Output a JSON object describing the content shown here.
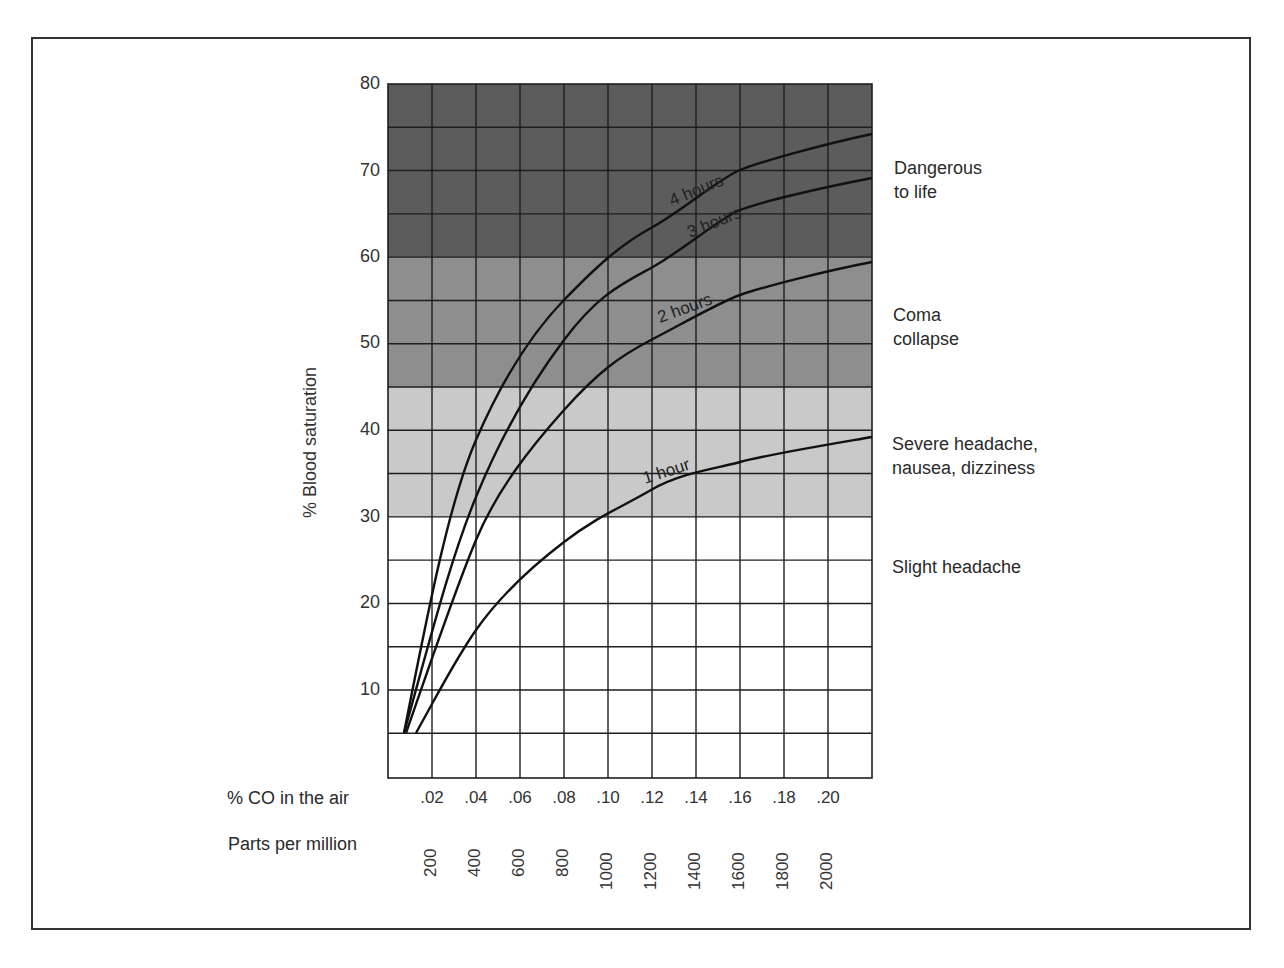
{
  "chart_data": {
    "type": "line",
    "title": "",
    "xlabel": "% CO in the air",
    "xlabel_secondary": "Parts per million",
    "ylabel": "% Blood saturation",
    "x_ticks": [
      ".02",
      ".04",
      ".06",
      ".08",
      ".10",
      ".12",
      ".14",
      ".16",
      ".18",
      ".20"
    ],
    "x_ticks_ppm": [
      "200",
      "400",
      "600",
      "800",
      "1000",
      "1200",
      "1400",
      "1600",
      "1800",
      "2000"
    ],
    "y_ticks": [
      "80",
      "70",
      "60",
      "50",
      "40",
      "30",
      "20",
      "10"
    ],
    "xlim": [
      0,
      0.22
    ],
    "ylim": [
      0,
      80
    ],
    "grid": true,
    "x": [
      0.007,
      0.04,
      0.06,
      0.08,
      0.1,
      0.12,
      0.16,
      0.22
    ],
    "series": [
      {
        "name": "4 hours",
        "values": [
          5,
          39,
          49,
          55,
          60,
          63,
          70,
          74
        ]
      },
      {
        "name": "3 hours",
        "values": [
          5,
          32,
          43,
          51,
          55,
          59,
          65,
          69
        ]
      },
      {
        "name": "2 hours",
        "values": [
          5,
          27,
          36,
          42,
          47,
          51,
          56,
          60
        ]
      },
      {
        "name": "1 hour",
        "values": [
          5,
          17,
          23,
          27,
          30,
          33,
          36,
          39
        ]
      }
    ],
    "bands": [
      {
        "from": 60,
        "to": 80,
        "label": "Dangerous to life",
        "color": "#5c5c5c"
      },
      {
        "from": 45,
        "to": 60,
        "label": "Coma collapse",
        "color": "#8e8e8e"
      },
      {
        "from": 30,
        "to": 45,
        "label": "Severe headache, nausea, dizziness",
        "color": "#c9c9c9"
      },
      {
        "from": 0,
        "to": 30,
        "label": "Slight headache",
        "color": "#ffffff"
      }
    ]
  },
  "labels": {
    "y_axis": "% Blood saturation",
    "x_axis_pct": "% CO in the air",
    "x_axis_ppm": "Parts per million",
    "curve_4h": "4 hours",
    "curve_3h": "3 hours",
    "curve_2h": "2 hours",
    "curve_1h": "1 hour",
    "zone_danger_1": "Dangerous",
    "zone_danger_2": "to life",
    "zone_coma_1": "Coma",
    "zone_coma_2": "collapse",
    "zone_severe_1": "Severe headache,",
    "zone_severe_2": "nausea, dizziness",
    "zone_slight": "Slight headache"
  },
  "y_ticks": [
    {
      "label": "80",
      "y": 84
    },
    {
      "label": "70",
      "y": 171
    },
    {
      "label": "60",
      "y": 257
    },
    {
      "label": "50",
      "y": 343
    },
    {
      "label": "40",
      "y": 430
    },
    {
      "label": "30",
      "y": 517
    },
    {
      "label": "20",
      "y": 603
    },
    {
      "label": "10",
      "y": 690
    }
  ],
  "x_ticks": [
    {
      "pct": ".02",
      "ppm": "200"
    },
    {
      "pct": ".04",
      "ppm": "400"
    },
    {
      "pct": ".06",
      "ppm": "600"
    },
    {
      "pct": ".08",
      "ppm": "800"
    },
    {
      "pct": ".10",
      "ppm": "1000"
    },
    {
      "pct": ".12",
      "ppm": "1200"
    },
    {
      "pct": ".14",
      "ppm": "1400"
    },
    {
      "pct": ".16",
      "ppm": "1600"
    },
    {
      "pct": ".18",
      "ppm": "1800"
    },
    {
      "pct": ".20",
      "ppm": "2000"
    }
  ]
}
